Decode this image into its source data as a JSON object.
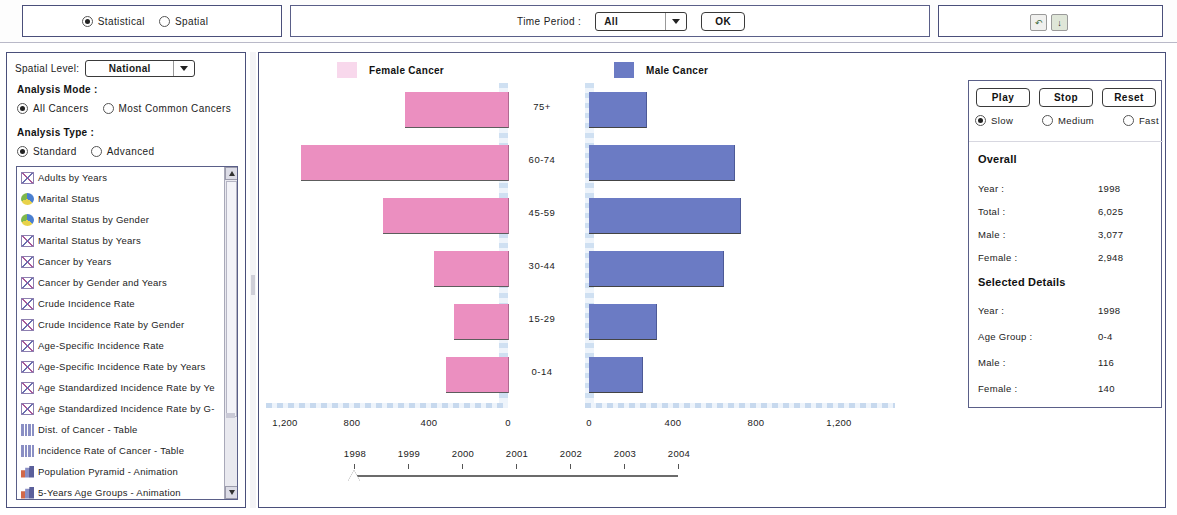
{
  "topbar": {
    "mode_options": [
      {
        "label": "Statistical",
        "selected": true
      },
      {
        "label": "Spatial",
        "selected": false
      }
    ],
    "time_period_label": "Time Period :",
    "time_period_value": "All",
    "ok_label": "OK",
    "icons": [
      {
        "name": "back-icon",
        "glyph": "↶"
      },
      {
        "name": "save-icon",
        "glyph": "↓"
      }
    ]
  },
  "sidebar": {
    "spatial_level_label": "Spatial Level:",
    "spatial_level_value": "National",
    "analysis_mode_heading": "Analysis Mode :",
    "analysis_mode_options": [
      {
        "label": "All Cancers",
        "selected": true
      },
      {
        "label": "Most Common Cancers",
        "selected": false
      }
    ],
    "analysis_type_heading": "Analysis Type :",
    "analysis_type_options": [
      {
        "label": "Standard",
        "selected": true
      },
      {
        "label": "Advanced",
        "selected": false
      }
    ],
    "list_items": [
      {
        "label": "Adults by Years",
        "icon": "people-chart-icon",
        "selected": false
      },
      {
        "label": "Marital Status",
        "icon": "pie-chart-icon",
        "selected": false
      },
      {
        "label": "Marital Status by Gender",
        "icon": "pie-chart-icon",
        "selected": false
      },
      {
        "label": "Marital Status by Years",
        "icon": "people-chart-icon",
        "selected": false
      },
      {
        "label": "Cancer by Years",
        "icon": "people-chart-icon",
        "selected": false
      },
      {
        "label": "Cancer by Gender and Years",
        "icon": "people-chart-icon",
        "selected": false
      },
      {
        "label": "Crude Incidence Rate",
        "icon": "people-chart-icon",
        "selected": false
      },
      {
        "label": "Crude Incidence Rate by Gender",
        "icon": "people-chart-icon",
        "selected": false
      },
      {
        "label": "Age-Specific Incidence Rate",
        "icon": "people-chart-icon",
        "selected": false
      },
      {
        "label": "Age-Specific Incidence Rate by Years",
        "icon": "people-chart-icon",
        "selected": false
      },
      {
        "label": "Age Standardized Incidence Rate by Ye",
        "icon": "people-chart-icon",
        "selected": false
      },
      {
        "label": "Age Standardized Incidence Rate by G-",
        "icon": "people-chart-icon",
        "selected": false
      },
      {
        "label": "Dist. of Cancer - Table",
        "icon": "table-icon",
        "selected": false
      },
      {
        "label": "Incidence Rate of Cancer - Table",
        "icon": "table-icon",
        "selected": false
      },
      {
        "label": "Population Pyramid - Animation",
        "icon": "bar-chart-icon",
        "selected": false
      },
      {
        "label": "5-Years Age Groups - Animation",
        "icon": "bar-chart-icon",
        "selected": false
      },
      {
        "label": "15-Years Age Groups - Animation",
        "icon": "bar-chart-icon",
        "selected": true
      }
    ]
  },
  "controls": {
    "play_label": "Play",
    "stop_label": "Stop",
    "reset_label": "Reset",
    "speed_options": [
      {
        "label": "Slow",
        "selected": true
      },
      {
        "label": "Medium",
        "selected": false
      },
      {
        "label": "Fast",
        "selected": false
      }
    ],
    "overall_title": "Overall",
    "overall": [
      {
        "key": "Year :",
        "value": "1998"
      },
      {
        "key": "Total  :",
        "value": "6,025"
      },
      {
        "key": "Male  :",
        "value": "3,077"
      },
      {
        "key": "Female  :",
        "value": "2,948"
      }
    ],
    "selected_title": "Selected Details",
    "selected": [
      {
        "key": "Year :",
        "value": "1998"
      },
      {
        "key": "Age Group :",
        "value": "0-4"
      },
      {
        "key": "Male  :",
        "value": "116"
      },
      {
        "key": "Female  :",
        "value": "140"
      }
    ]
  },
  "slider": {
    "years": [
      "1998",
      "1999",
      "2000",
      "2001",
      "2002",
      "2003",
      "2004"
    ],
    "current": "1998"
  },
  "chart_data": {
    "type": "bar",
    "title": "",
    "subtype": "population-pyramid",
    "categories": [
      "75+",
      "60-74",
      "45-59",
      "30-44",
      "15-29",
      "0-14"
    ],
    "series": [
      {
        "name": "Female Cancer",
        "color": "#eb8fc0",
        "direction": "left",
        "values": [
          545,
          1100,
          665,
          395,
          285,
          330
        ]
      },
      {
        "name": "Male Cancer",
        "color": "#6b7bc4",
        "direction": "right",
        "values": [
          305,
          770,
          800,
          710,
          355,
          280
        ]
      }
    ],
    "left_ticks": [
      "1,200",
      "800",
      "400",
      "0"
    ],
    "right_ticks": [
      "0",
      "400",
      "800",
      "1,200"
    ],
    "xlim": [
      0,
      1200
    ],
    "xlabel": "",
    "ylabel": "",
    "grid": false,
    "legend_position": "top"
  }
}
